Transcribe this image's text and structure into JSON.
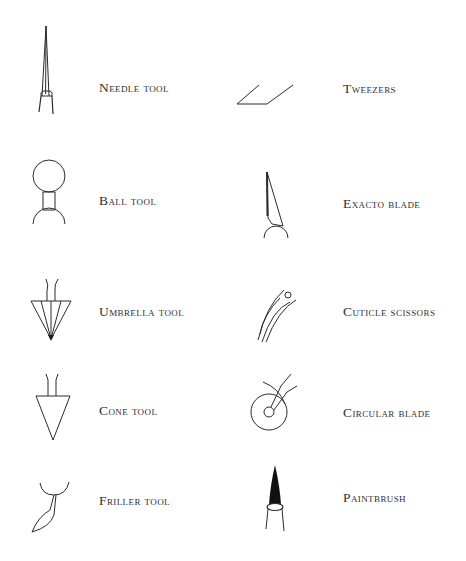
{
  "tools": {
    "left": [
      {
        "label": "Needle tool",
        "icon": "needle-tool-icon"
      },
      {
        "label": "Ball tool",
        "icon": "ball-tool-icon"
      },
      {
        "label": "Umbrella tool",
        "icon": "umbrella-tool-icon"
      },
      {
        "label": "Cone tool",
        "icon": "cone-tool-icon"
      },
      {
        "label": "Friller tool",
        "icon": "friller-tool-icon"
      }
    ],
    "right": [
      {
        "label": "Tweezers",
        "icon": "tweezers-icon"
      },
      {
        "label": "Exacto blade",
        "icon": "exacto-blade-icon"
      },
      {
        "label": "Cuticle scissors",
        "icon": "cuticle-scissors-icon"
      },
      {
        "label": "Circular blade",
        "icon": "circular-blade-icon"
      },
      {
        "label": "Paintbrush",
        "icon": "paintbrush-icon"
      }
    ]
  },
  "colors": {
    "ink": "#2b2b2b",
    "background": "#ffffff"
  }
}
